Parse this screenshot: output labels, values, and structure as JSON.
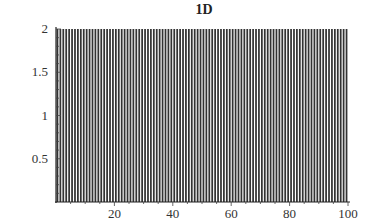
{
  "chart_data": {
    "type": "bar",
    "title": "1D",
    "xlabel": "",
    "ylabel": "",
    "xlim": [
      0,
      100
    ],
    "ylim": [
      0,
      2
    ],
    "x_ticks": [
      20,
      40,
      60,
      80,
      100
    ],
    "y_ticks": [
      0.5,
      1,
      1.5,
      2
    ],
    "x_tick_labels": [
      "20",
      "40",
      "60",
      "80",
      "100"
    ],
    "y_tick_labels": [
      "0.5",
      "1",
      "1.5",
      "2"
    ],
    "grid": false,
    "legend": null,
    "bar_count": 100,
    "bar_color": "#333333",
    "values": [
      2,
      2,
      2,
      2,
      2,
      2,
      2,
      2,
      2,
      2,
      2,
      2,
      2,
      2,
      2,
      2,
      2,
      2,
      2,
      2,
      2,
      2,
      2,
      2,
      2,
      2,
      2,
      2,
      2,
      2,
      2,
      2,
      2,
      2,
      2,
      2,
      2,
      2,
      2,
      2,
      2,
      2,
      2,
      2,
      2,
      2,
      2,
      2,
      2,
      2,
      2,
      2,
      2,
      2,
      2,
      2,
      2,
      2,
      2,
      2,
      2,
      2,
      2,
      2,
      2,
      2,
      2,
      2,
      2,
      2,
      2,
      2,
      2,
      2,
      2,
      2,
      2,
      2,
      2,
      2,
      2,
      2,
      2,
      2,
      2,
      2,
      2,
      2,
      2,
      2,
      2,
      2,
      2,
      2,
      2,
      2,
      2,
      2,
      2,
      2
    ]
  }
}
